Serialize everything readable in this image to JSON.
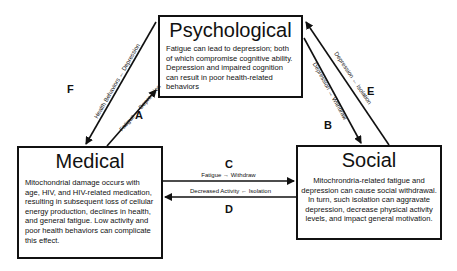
{
  "nodes": {
    "psychological": {
      "title": "Psychological",
      "body": "Fatigue can lead to depression; both of which compromise cognitive ability. Depression and impaired cognition can result in poor health-related behaviors"
    },
    "medical": {
      "title": "Medical",
      "body": "Mitochondrial damage occurs with age, HIV, and HIV-related medication, resulting in subsequent loss of cellular energy production, declines in health, and general fatigue. Low activity and poor health behaviors can complicate this effect."
    },
    "social": {
      "title": "Social",
      "body": "Mitochrondria-related fatigue and depression can cause social withdrawal. In turn, such isolation can aggravate depression, decrease physical activity levels, and impact general motivation."
    }
  },
  "edges": {
    "A": {
      "letter": "A",
      "label": "Fatigue → Depression",
      "from": "Medical",
      "to": "Psychological"
    },
    "B": {
      "letter": "B",
      "label": "Depression → Withdraw",
      "from": "Psychological",
      "to": "Social"
    },
    "C": {
      "letter": "C",
      "label": "Fatigue → Withdraw",
      "from": "Medical",
      "to": "Social"
    },
    "D": {
      "letter": "D",
      "label": "Decreased Activity ← Isolation",
      "from": "Social",
      "to": "Medical"
    },
    "E": {
      "letter": "E",
      "label": "Depression ← Isolation",
      "from": "Social",
      "to": "Psychological"
    },
    "F": {
      "letter": "F",
      "label": "Health Behaviors ← Depression",
      "from": "Psychological",
      "to": "Medical"
    }
  },
  "colors": {
    "stroke": "#111111",
    "background": "#ffffff"
  }
}
